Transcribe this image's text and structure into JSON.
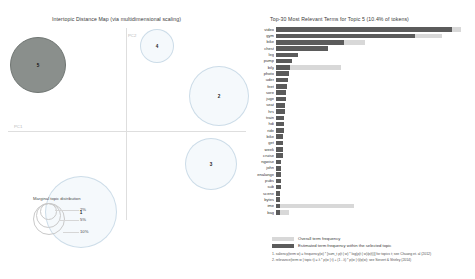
{
  "mds": {
    "title": "Intertopic Distance Map (via multidimensional scaling)",
    "axis_x_label": "PC1",
    "axis_y_label": "PC2",
    "legend_title": "Marginal topic distribution",
    "size_ticks": [
      "2%",
      "5%",
      "10%"
    ],
    "selected_color": "#8a8f8c",
    "bubble_color": "#1f77b4",
    "topics": [
      {
        "label": "5",
        "x": 38,
        "y": 65,
        "r": 28,
        "selected": true
      },
      {
        "label": "4",
        "x": 157,
        "y": 46,
        "r": 17,
        "selected": false
      },
      {
        "label": "2",
        "x": 219,
        "y": 96,
        "r": 30,
        "selected": false
      },
      {
        "label": "3",
        "x": 211,
        "y": 164,
        "r": 26,
        "selected": false
      },
      {
        "label": "1",
        "x": 81,
        "y": 212,
        "r": 36,
        "selected": false
      }
    ]
  },
  "bars": {
    "title": "Top-30 Most Relevant Terms for Topic 5 (10.4% of tokens)",
    "legend_overall": "Overall term frequency",
    "legend_selected": "Estimated term frequency within the selected topic",
    "note1": "1. saliency(term w) = frequency(w) * [sum_t p(t | w) * log(p(t | w)/p(t))] for topics t; see Chuang et. al (2012)",
    "note2": "2. relevance(term w | topic t) = λ * p(w | t) + (1 - λ) * p(w | t)/p(w); see Sievert & Shirley (2014)",
    "color_overall": "#d8d8d8",
    "color_selected": "#5b5b5b"
  },
  "chart_data": {
    "type": "bar",
    "title": "Top-30 Most Relevant Terms for Topic 5 (10.4% of tokens)",
    "xlabel": "",
    "ylabel": "",
    "orientation": "horizontal",
    "grid": false,
    "legend_position": "bottom",
    "categories": [
      "video",
      "gym",
      "bike",
      "chest",
      "leg",
      "pump",
      "bily",
      "photo",
      "uder",
      "feet",
      "sore",
      "juge",
      "seat",
      "hrs",
      "train",
      "hdi",
      "ride",
      "bike",
      "get",
      "week",
      "cruise",
      "ngwise",
      "john",
      "enalange",
      "pubs",
      "sub",
      "scene",
      "bytes",
      "ime",
      "bag"
    ],
    "series": [
      {
        "name": "Overall term frequency",
        "values": [
          170,
          152,
          82,
          0,
          0,
          0,
          60,
          0,
          0,
          0,
          0,
          0,
          0,
          0,
          0,
          0,
          0,
          0,
          0,
          0,
          0,
          0,
          0,
          0,
          0,
          0,
          0,
          0,
          72,
          12
        ]
      },
      {
        "name": "Estimated term frequency within the selected topic",
        "values": [
          162,
          128,
          62,
          48,
          20,
          15,
          13,
          12,
          11,
          10,
          9,
          9,
          8,
          8,
          7,
          7,
          7,
          6,
          6,
          6,
          6,
          5,
          5,
          5,
          5,
          5,
          4,
          4,
          4,
          4
        ]
      }
    ],
    "xlim": [
      0,
      180
    ]
  }
}
